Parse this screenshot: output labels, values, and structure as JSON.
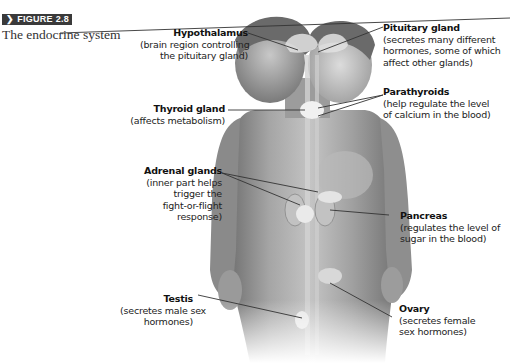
{
  "figure": {
    "badge_icon": "chevron-right-icon",
    "badge_label": "FIGURE 2.8",
    "title": "The endocrine system"
  },
  "labels": {
    "hypothalamus": {
      "title": "Hypothalamus",
      "desc": [
        "(brain region controlling",
        "the pituitary gland)"
      ]
    },
    "pituitary": {
      "title": "Pituitary gland",
      "desc": [
        "(secretes many different",
        "hormones, some of which",
        "affect other glands)"
      ]
    },
    "parathyroids": {
      "title": "Parathyroids",
      "desc": [
        "(help regulate the level",
        "of calcium in the blood)"
      ]
    },
    "thyroid": {
      "title": "Thyroid gland",
      "desc": [
        "(affects metabolism)"
      ]
    },
    "adrenal": {
      "title": "Adrenal glands",
      "desc": [
        "(inner part helps",
        "trigger the",
        "fight-or-flight",
        "response)"
      ]
    },
    "pancreas": {
      "title": "Pancreas",
      "desc": [
        "(regulates the level of",
        "sugar in the blood)"
      ]
    },
    "testis": {
      "title": "Testis",
      "desc": [
        "(secretes male sex",
        "hormones)"
      ]
    },
    "ovary": {
      "title": "Ovary",
      "desc": [
        "(secretes female",
        "sex hormones)"
      ]
    }
  },
  "colors": {
    "badge_bg": "#3a3a3a",
    "skin_dark": "#8a8a8a",
    "skin_light": "#d6d6d6",
    "gland": "#e6e6e6",
    "leader_line": "#333333"
  }
}
